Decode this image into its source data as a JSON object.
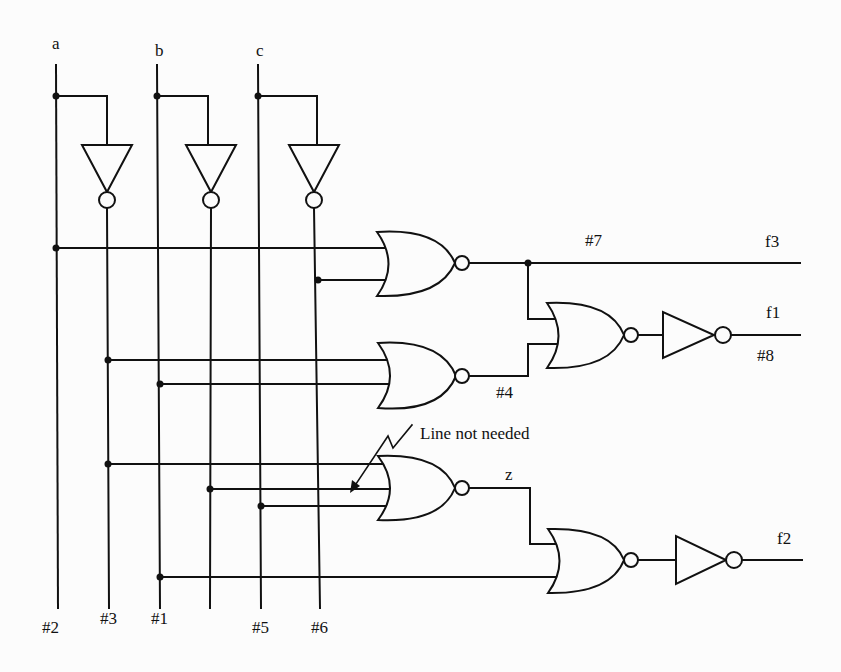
{
  "diagram": {
    "type": "logic-circuit",
    "inputs": [
      {
        "id": "a",
        "label": "a"
      },
      {
        "id": "b",
        "label": "b"
      },
      {
        "id": "c",
        "label": "c"
      }
    ],
    "bottom_labels": {
      "a": "#2",
      "a_not": "#3",
      "b": "#1",
      "c": "#5",
      "c_not": "#6"
    },
    "net_labels": {
      "n7": "#7",
      "n4": "#4",
      "n8": "#8",
      "z": "z"
    },
    "outputs": {
      "f3": "f3",
      "f1": "f1",
      "f2": "f2"
    },
    "annotation": "Line not needed",
    "gates": [
      {
        "id": "inv-a",
        "kind": "NOT",
        "inputs": [
          "a"
        ],
        "output": "a'"
      },
      {
        "id": "inv-b",
        "kind": "NOT",
        "inputs": [
          "b"
        ],
        "output": "b'"
      },
      {
        "id": "inv-c",
        "kind": "NOT",
        "inputs": [
          "c"
        ],
        "output": "c'"
      },
      {
        "id": "nor1",
        "kind": "NOR",
        "inputs": [
          "a",
          "c'"
        ],
        "output": "#7"
      },
      {
        "id": "nor2",
        "kind": "NOR",
        "inputs": [
          "a'",
          "b"
        ],
        "output": "#4"
      },
      {
        "id": "nor3",
        "kind": "NOR",
        "inputs": [
          "#7",
          "#4"
        ],
        "output": "f1'"
      },
      {
        "id": "inv-f1",
        "kind": "NOT",
        "inputs": [
          "f1'"
        ],
        "output": "f1"
      },
      {
        "id": "nor4",
        "kind": "NOR",
        "inputs": [
          "a'",
          "b'",
          "c"
        ],
        "output": "z"
      },
      {
        "id": "nor5",
        "kind": "NOR",
        "inputs": [
          "z",
          "b"
        ],
        "output": "f2'"
      },
      {
        "id": "inv-f2",
        "kind": "NOT",
        "inputs": [
          "f2'"
        ],
        "output": "f2"
      }
    ]
  }
}
